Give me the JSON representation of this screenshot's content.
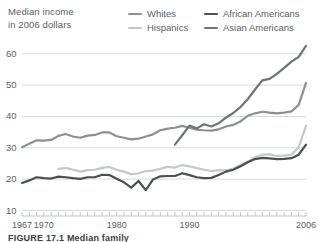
{
  "axis_title": {
    "line1": "Median income",
    "line2": "in 2006 dollars"
  },
  "legend": {
    "items": [
      {
        "label": "Whites",
        "color": "#8c9093",
        "column": 1,
        "row": 1
      },
      {
        "label": "African Americans",
        "color": "#4b4f52",
        "column": 2,
        "row": 1
      },
      {
        "label": "Hispanics",
        "color": "#c4c8ca",
        "column": 1,
        "row": 2
      },
      {
        "label": "Asian Americans",
        "color": "#6e7376",
        "column": 2,
        "row": 2
      }
    ]
  },
  "caption": "FIGURE 17.1  Median family",
  "chart_data": {
    "type": "line",
    "title": "",
    "subtitle": "",
    "xlabel": "",
    "ylabel": "Median income in 2006 dollars",
    "xlim": [
      1967,
      2006
    ],
    "ylim": [
      10,
      62
    ],
    "grid": true,
    "grid_axis": "y",
    "legend_position": "top-right",
    "y_ticks": [
      10,
      20,
      30,
      40,
      50,
      60
    ],
    "y_tick_labels": [
      "10",
      "20",
      "30",
      "40",
      "50",
      "60"
    ],
    "x_tick_labels": [
      "1967",
      "1970",
      "1980",
      "1990",
      "2006"
    ],
    "x_tick_label_years": [
      1967,
      1970,
      1980,
      1990,
      2006
    ],
    "x_minor_tick_interval": 1,
    "units": "thousands of 2006 dollars",
    "series": [
      {
        "name": "Whites",
        "color": "#8c9093",
        "x": [
          1967,
          1968,
          1969,
          1970,
          1971,
          1972,
          1973,
          1974,
          1975,
          1976,
          1977,
          1978,
          1979,
          1980,
          1981,
          1982,
          1983,
          1984,
          1985,
          1986,
          1987,
          1988,
          1989,
          1990,
          1991,
          1992,
          1993,
          1994,
          1995,
          1996,
          1997,
          1998,
          1999,
          2000,
          2001,
          2002,
          2003,
          2004,
          2005,
          2006
        ],
        "values": [
          30.2,
          31.3,
          32.4,
          32.3,
          32.5,
          33.8,
          34.4,
          33.6,
          33.2,
          33.9,
          34.1,
          34.9,
          34.9,
          33.7,
          33.2,
          32.7,
          32.9,
          33.6,
          34.3,
          35.6,
          36.1,
          36.4,
          37.0,
          36.4,
          35.8,
          35.6,
          35.5,
          35.9,
          36.8,
          37.3,
          38.4,
          40.2,
          41.0,
          41.5,
          41.2,
          41.0,
          41.2,
          41.6,
          43.7,
          50.7
        ]
      },
      {
        "name": "Hispanics",
        "color": "#c4c8ca",
        "x": [
          1972,
          1973,
          1974,
          1975,
          1976,
          1977,
          1978,
          1979,
          1980,
          1981,
          1982,
          1983,
          1984,
          1985,
          1986,
          1987,
          1988,
          1989,
          1990,
          1991,
          1992,
          1993,
          1994,
          1995,
          1996,
          1997,
          1998,
          1999,
          2000,
          2001,
          2002,
          2003,
          2004,
          2005,
          2006
        ],
        "values": [
          23.3,
          23.6,
          23.0,
          22.4,
          22.9,
          23.0,
          23.6,
          23.9,
          23.0,
          22.4,
          21.6,
          21.8,
          22.6,
          22.7,
          23.3,
          23.9,
          23.7,
          24.5,
          24.1,
          23.5,
          23.0,
          22.6,
          22.9,
          22.8,
          23.3,
          24.5,
          25.6,
          27.0,
          27.8,
          27.9,
          27.4,
          27.5,
          27.8,
          30.2,
          37.0
        ]
      },
      {
        "name": "African Americans",
        "color": "#4b4f52",
        "x": [
          1967,
          1968,
          1969,
          1970,
          1971,
          1972,
          1973,
          1974,
          1975,
          1976,
          1977,
          1978,
          1979,
          1980,
          1981,
          1982,
          1983,
          1984,
          1985,
          1986,
          1987,
          1988,
          1989,
          1990,
          1991,
          1992,
          1993,
          1994,
          1995,
          1996,
          1997,
          1998,
          1999,
          2000,
          2001,
          2002,
          2003,
          2004,
          2005,
          2006
        ],
        "values": [
          18.8,
          19.6,
          20.6,
          20.3,
          20.2,
          20.8,
          20.6,
          20.3,
          20.1,
          20.6,
          20.6,
          21.4,
          21.3,
          20.1,
          19.0,
          17.3,
          19.4,
          16.5,
          19.9,
          20.9,
          21.0,
          21.0,
          21.9,
          21.3,
          20.6,
          20.3,
          20.4,
          21.3,
          22.4,
          23.0,
          24.1,
          25.4,
          26.4,
          26.8,
          26.6,
          26.4,
          26.5,
          26.7,
          27.8,
          31.0
        ]
      },
      {
        "name": "Asian Americans",
        "color": "#6e7376",
        "x": [
          1988,
          1989,
          1990,
          1991,
          1992,
          1993,
          1994,
          1995,
          1996,
          1997,
          1998,
          1999,
          2000,
          2001,
          2002,
          2003,
          2004,
          2005,
          2006
        ],
        "values": [
          31.0,
          34.0,
          37.1,
          36.2,
          37.5,
          36.8,
          37.8,
          39.6,
          41.1,
          43.0,
          45.5,
          48.6,
          51.5,
          52.0,
          53.6,
          55.5,
          57.5,
          59.0,
          62.5
        ]
      }
    ]
  }
}
